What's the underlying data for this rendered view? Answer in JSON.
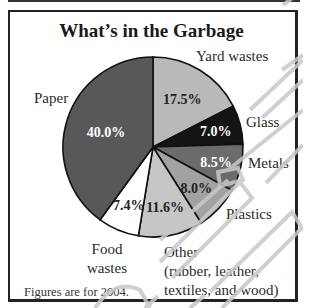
{
  "chart_data": {
    "type": "pie",
    "title": "What’s in the Garbage",
    "start_angle": "12 o'clock, clockwise",
    "categories": [
      "Yard wastes",
      "Glass",
      "Metals",
      "Plastics",
      "Other (rubber, leather, textiles, and wood)",
      "Food wastes",
      "Paper"
    ],
    "values": [
      17.5,
      7.0,
      8.5,
      8.0,
      11.6,
      7.4,
      40.0
    ],
    "value_labels": [
      "17.5%",
      "7.0%",
      "8.5%",
      "8.0%",
      "11.6%",
      "7.4%",
      "40.0%"
    ],
    "colors": [
      "#b9b9b9",
      "#141414",
      "#6b6b6b",
      "#a2a2a2",
      "#c6c6c6",
      "#ffffff",
      "#585858"
    ],
    "label_colors": [
      "#222222",
      "#ffffff",
      "#ffffff",
      "#222222",
      "#222222",
      "#222222",
      "#ffffff"
    ],
    "units": "%",
    "note": "Figures are for 2004."
  },
  "labels": {
    "yard": "Yard wastes",
    "glass": "Glass",
    "metals": "Metals",
    "plastics": "Plastics",
    "other_line1": "Other",
    "other_line2": "(rubber, leather,",
    "other_line3": "textiles, and wood)",
    "food_line1": "Food",
    "food_line2": "wastes",
    "paper": "Paper"
  },
  "footnote": "Figures are for 2004."
}
